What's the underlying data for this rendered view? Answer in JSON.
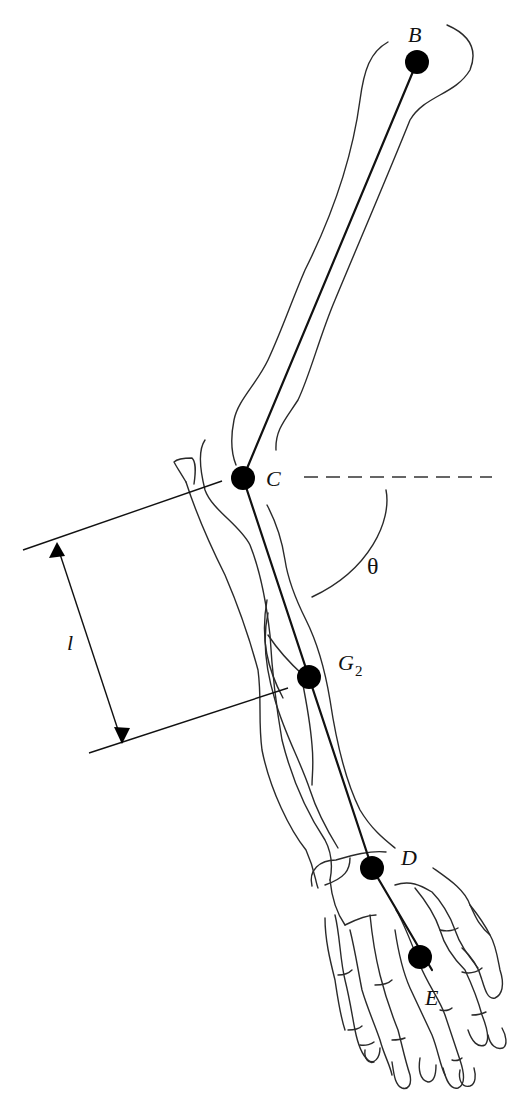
{
  "figure": {
    "points": {
      "B": {
        "label": "B"
      },
      "C": {
        "label": "C"
      },
      "G2": {
        "label": "G",
        "subscript": "2"
      },
      "D": {
        "label": "D"
      },
      "E": {
        "label": "E"
      }
    },
    "angle_label": "θ",
    "length_label": "l",
    "colors": {
      "ink": "#111111",
      "outline": "#2a2a2a",
      "background": "#ffffff"
    }
  }
}
